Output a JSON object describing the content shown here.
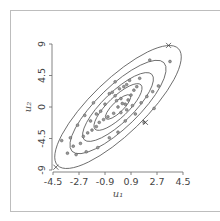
{
  "chart_data": {
    "type": "scatter",
    "title": "",
    "xlabel": "u1",
    "ylabel": "u2",
    "xlabel_display": "u₁",
    "ylabel_display": "u₂",
    "xlim": [
      -4.5,
      4.5
    ],
    "ylim": [
      -9,
      9
    ],
    "xticks": [
      "-4.5",
      "-2.7",
      "-0.9",
      "0.9",
      "2.7",
      "4.5"
    ],
    "yticks": [
      "9",
      "4.5",
      "0",
      "-4.5",
      "-9"
    ],
    "grid": false,
    "legend": null,
    "contours": {
      "type": "ellipse",
      "center": [
        0,
        0
      ],
      "levels": 5,
      "description": "Concentric elliptical density contours of a positively correlated bivariate distribution"
    },
    "series": [
      {
        "name": "samples",
        "marker": "o",
        "points": [
          [
            -0.6,
            1.9
          ],
          [
            -0.4,
            2.1
          ],
          [
            -0.2,
            1.6
          ],
          [
            0.1,
            2.6
          ],
          [
            0.4,
            2.9
          ],
          [
            0.6,
            3.2
          ],
          [
            0.2,
            1.2
          ],
          [
            -0.1,
            0.9
          ],
          [
            0.3,
            0.5
          ],
          [
            0.0,
            0.0
          ],
          [
            0.5,
            0.4
          ],
          [
            0.7,
            1.0
          ],
          [
            0.9,
            1.7
          ],
          [
            1.1,
            2.4
          ],
          [
            1.3,
            2.9
          ],
          [
            1.0,
            0.2
          ],
          [
            0.6,
            -0.4
          ],
          [
            0.2,
            -0.8
          ],
          [
            -0.3,
            -0.9
          ],
          [
            -0.7,
            -1.4
          ],
          [
            -1.0,
            -1.8
          ],
          [
            -1.3,
            -2.2
          ],
          [
            -1.5,
            -2.8
          ],
          [
            -1.8,
            -3.3
          ],
          [
            -2.1,
            -3.7
          ],
          [
            -2.4,
            -4.2
          ],
          [
            -1.2,
            -0.6
          ],
          [
            -0.9,
            0.4
          ],
          [
            -1.5,
            -1.0
          ],
          [
            -1.9,
            -2.0
          ],
          [
            -2.6,
            -5.2
          ],
          [
            -3.1,
            -5.6
          ],
          [
            -3.5,
            -6.6
          ],
          [
            -3.9,
            -4.8
          ],
          [
            -3.3,
            -4.4
          ],
          [
            -2.9,
            -6.8
          ],
          [
            -2.2,
            -6.4
          ],
          [
            -1.4,
            -5.8
          ],
          [
            -0.6,
            -4.4
          ],
          [
            0.0,
            -3.6
          ],
          [
            0.5,
            -2.0
          ],
          [
            1.2,
            -1.0
          ],
          [
            1.6,
            0.6
          ],
          [
            2.0,
            1.5
          ],
          [
            2.4,
            2.2
          ],
          [
            2.8,
            3.0
          ],
          [
            2.2,
            6.7
          ],
          [
            3.6,
            6.5
          ],
          [
            1.8,
            -2.2
          ],
          [
            2.5,
            -0.2
          ],
          [
            -0.2,
            3.6
          ],
          [
            -1.7,
            0.6
          ],
          [
            -2.3,
            -1.2
          ],
          [
            -2.8,
            -2.6
          ],
          [
            0.8,
            3.8
          ],
          [
            1.5,
            4.1
          ]
        ]
      },
      {
        "name": "extremes",
        "marker": "x",
        "points": [
          [
            3.5,
            8.8
          ],
          [
            -4.3,
            -8.6
          ],
          [
            1.9,
            -2.2
          ]
        ]
      }
    ]
  }
}
